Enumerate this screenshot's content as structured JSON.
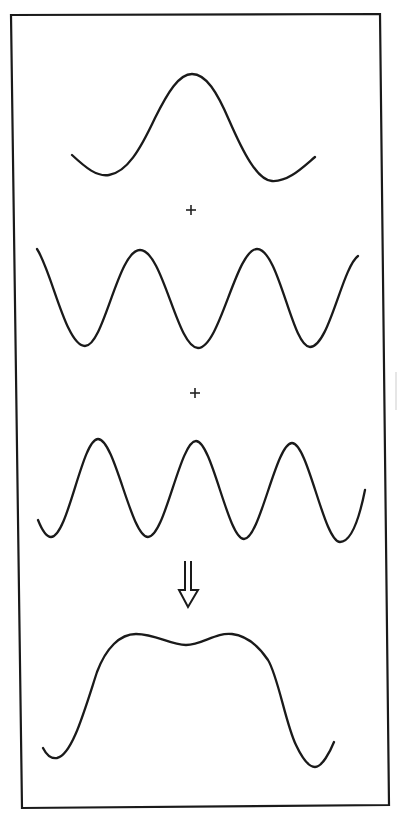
{
  "figure": {
    "frame": {
      "points": "11,15 380,14 389,805 22,808",
      "color": "#1a1a1a"
    },
    "components": [
      {
        "name": "fundamental-wave",
        "description": "Single broad hump (fundamental)",
        "path": "M72,155 C86,168 97,177 109,175 C127,172 140,150 155,118 C168,92 179,74 192,74 C206,74 217,92 229,120 C243,152 257,180 272,181 C288,182 302,168 315,157"
      },
      {
        "name": "second-component-wave",
        "description": "Two full periods, peaks at x=140 and x=257",
        "path": "M37,249 C52,272 66,346 85,346 C104,346 118,250 140,250 C163,250 177,348 198,348 C220,348 236,249 257,249 C279,249 292,347 310,347 C329,347 342,268 358,256"
      },
      {
        "name": "third-component-wave",
        "description": "Three peaks at x=98, x=196, x=292",
        "path": "M38,520 C42,530 46,537 51,537 C68,537 82,439 98,439 C115,439 131,537 148,537 C165,537 180,441 196,441 C212,441 228,539 244,539 C260,539 276,443 292,443 C308,443 324,542 340,542 C352,542 360,515 365,490"
      },
      {
        "name": "resultant-wave",
        "description": "Sum of components: flat-topped pulse with slight central dip",
        "path": "M43,748 C47,756 51,759 57,758 C72,755 84,712 97,672 C106,648 120,634 136,634 C156,634 170,645 186,645 C202,645 216,632 232,634 C248,636 260,648 268,660 C278,676 286,725 296,745 C304,762 310,767 315,767 C322,767 330,752 334,742"
      }
    ],
    "operators": [
      {
        "name": "plus-operator-1",
        "symbol": "+",
        "x": 191,
        "y": 210
      },
      {
        "name": "plus-operator-2",
        "symbol": "+",
        "x": 195,
        "y": 393
      }
    ],
    "result_arrow": {
      "symbol": "⇓",
      "shaft_left": 185,
      "shaft_right": 191,
      "shaft_top": 561,
      "head_top": 590,
      "head_left": 179,
      "head_right": 198,
      "tip_x": 188,
      "tip_y": 607
    },
    "labels": {
      "plus_1": "+",
      "plus_2": "+",
      "arrow": "⇓"
    }
  }
}
